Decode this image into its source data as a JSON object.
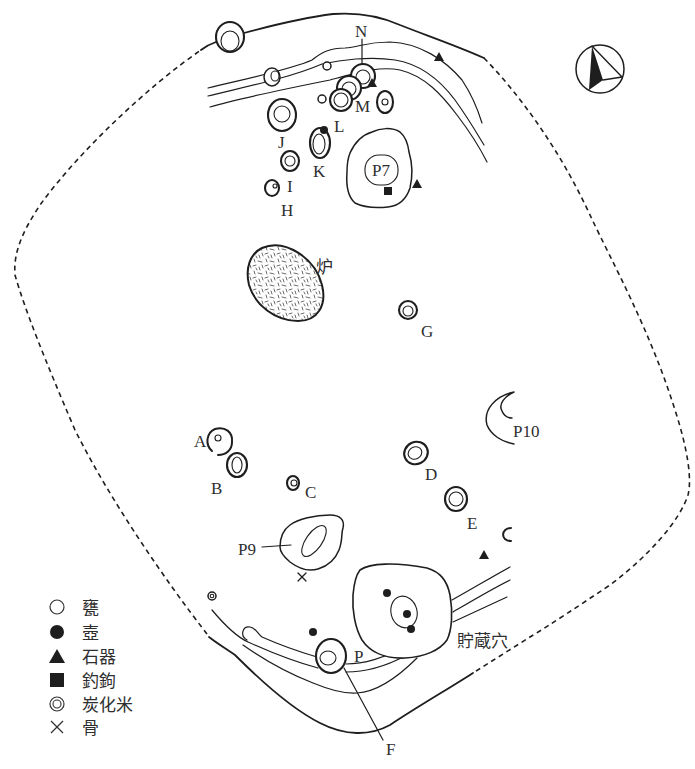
{
  "figure": {
    "kind": "dwelling-plan",
    "north_arrow": {
      "symbol": "north-arrow"
    },
    "hearth": {
      "label": "炉"
    },
    "storage_pit": {
      "label": "貯蔵穴"
    },
    "pits": {
      "A": "A",
      "B": "B",
      "C": "C",
      "D": "D",
      "E": "E",
      "F": "F",
      "G": "G",
      "H": "H",
      "I": "I",
      "J": "J",
      "K": "K",
      "L": "L",
      "M": "M",
      "N": "N",
      "P": "P"
    },
    "postholes": {
      "P7": "P7",
      "P9": "P9",
      "P10": "P10"
    }
  },
  "legend": {
    "items": [
      {
        "symbol": "open-circle",
        "label": "甕"
      },
      {
        "symbol": "filled-circle",
        "label": "壺"
      },
      {
        "symbol": "filled-triangle",
        "label": "石器"
      },
      {
        "symbol": "filled-square",
        "label": "釣鉤"
      },
      {
        "symbol": "double-circle",
        "label": "炭化米"
      },
      {
        "symbol": "cross",
        "label": "骨"
      }
    ]
  },
  "colors": {
    "ink": "#1e1e1e",
    "background": "#ffffff"
  }
}
